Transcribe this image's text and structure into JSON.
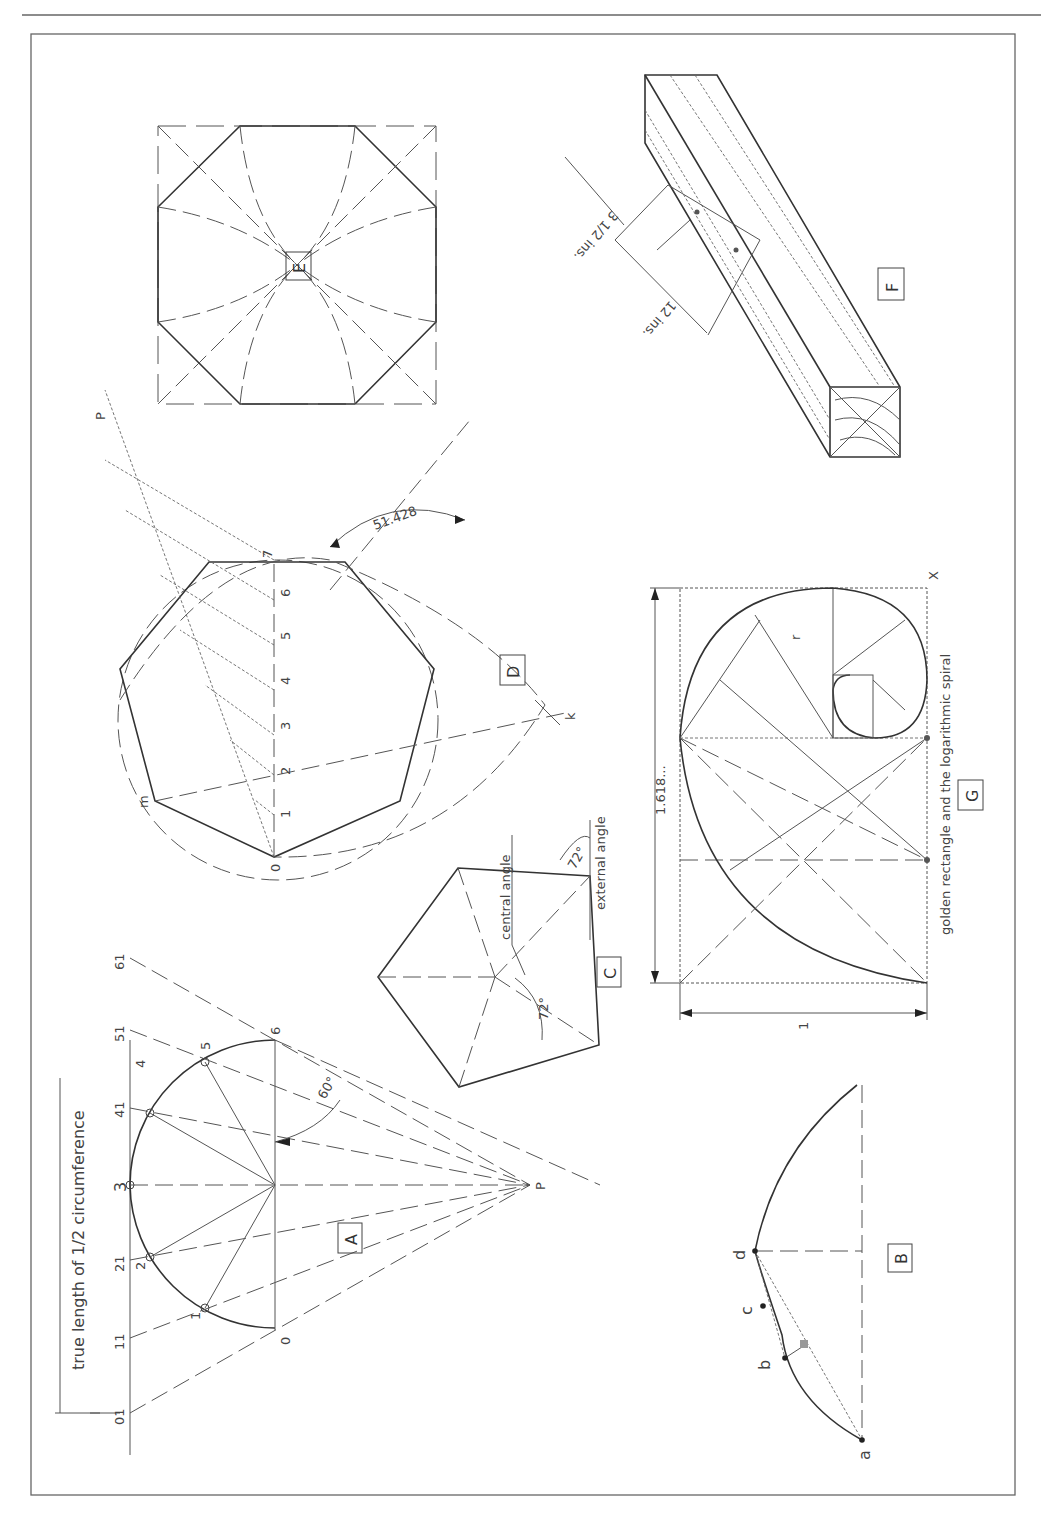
{
  "sheet": {
    "frame_color": "#555555",
    "figures": {
      "A": {
        "box_label": "A",
        "dimension_text": "true length of 1/2 circumference",
        "angle_label": "60°",
        "pole_label": "P",
        "arc_points": [
          "0",
          "1",
          "2",
          "3",
          "4",
          "5",
          "6"
        ],
        "line_points": [
          "01",
          "11",
          "21",
          "3",
          "41",
          "51",
          "61"
        ]
      },
      "B": {
        "box_label": "B",
        "points": [
          "a",
          "b",
          "c",
          "d"
        ]
      },
      "C": {
        "box_label": "C",
        "central_label": "central angle",
        "external_label": "external angle",
        "central_value": "72°",
        "external_value": "72°"
      },
      "D": {
        "box_label": "D",
        "angle_value": "51.428",
        "scale_points": [
          "0",
          "1",
          "2",
          "3",
          "4",
          "5",
          "6",
          "7"
        ],
        "vertex_labels": {
          "m": "m",
          "k": "k",
          "p": "P"
        }
      },
      "E": {
        "box_label": "E"
      },
      "F": {
        "box_label": "F",
        "dim_a": "3 1/2 ins.",
        "dim_b": "12 ins."
      },
      "G": {
        "box_label": "G",
        "caption": "golden rectangle and the logarithmic spiral",
        "long_dim": "1.618...",
        "short_dim": "1",
        "radius_label": "r",
        "corner_label": "X"
      }
    }
  }
}
